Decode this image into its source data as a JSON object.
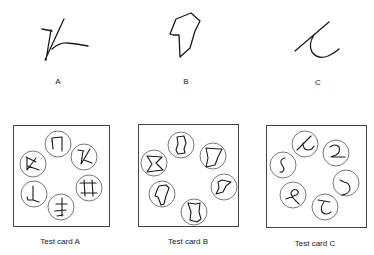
{
  "samples": [
    {
      "id": "A",
      "label": "A"
    },
    {
      "id": "B",
      "label": "B"
    },
    {
      "id": "C",
      "label": "C"
    }
  ],
  "cards": [
    {
      "id": "A",
      "label": "Test card A",
      "items": 6
    },
    {
      "id": "B",
      "label": "Test card B",
      "items": 6
    },
    {
      "id": "C",
      "label": "Test card C",
      "items": 6
    }
  ]
}
